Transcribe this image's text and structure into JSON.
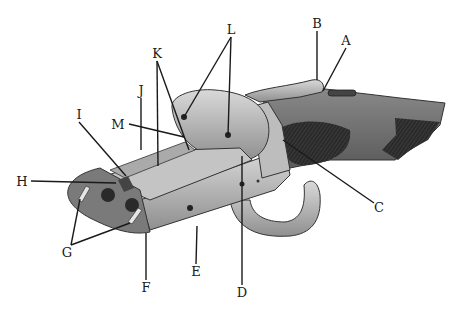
{
  "figure": {
    "style": "pencil illustration, grayscale",
    "colors": {
      "background": "#ffffff",
      "ink": "#1a1a1a",
      "metal_light": "#c8c8c8",
      "metal_mid": "#9a9a9a",
      "wood": "#6e6e6e",
      "checkering": "#2e2e2e"
    }
  },
  "labels": [
    {
      "id": "A",
      "text": "A",
      "x": 346,
      "y": 45,
      "targets": [
        [
          323,
          91
        ]
      ]
    },
    {
      "id": "B",
      "text": "B",
      "x": 317,
      "y": 28,
      "targets": [
        [
          317,
          80
        ]
      ]
    },
    {
      "id": "C",
      "text": "C",
      "x": 379,
      "y": 212,
      "targets": [
        [
          283,
          140
        ]
      ]
    },
    {
      "id": "D",
      "text": "D",
      "x": 242,
      "y": 297,
      "targets": [
        [
          242,
          156
        ]
      ]
    },
    {
      "id": "E",
      "text": "E",
      "x": 196,
      "y": 276,
      "targets": [
        [
          197,
          226
        ]
      ]
    },
    {
      "id": "F",
      "text": "F",
      "x": 146,
      "y": 292,
      "targets": [
        [
          146,
          233
        ]
      ]
    },
    {
      "id": "G",
      "text": "G",
      "x": 67,
      "y": 257,
      "targets": [
        [
          80,
          199
        ],
        [
          130,
          223
        ]
      ]
    },
    {
      "id": "H",
      "text": "H",
      "x": 22,
      "y": 186,
      "targets": [
        [
          116,
          183
        ]
      ]
    },
    {
      "id": "I",
      "text": "I",
      "x": 79,
      "y": 119,
      "targets": [
        [
          126,
          176
        ]
      ]
    },
    {
      "id": "J",
      "text": "J",
      "x": 141,
      "y": 95,
      "targets": [
        [
          141,
          150
        ]
      ]
    },
    {
      "id": "K",
      "text": "K",
      "x": 157,
      "y": 58,
      "targets": [
        [
          158,
          166
        ],
        [
          189,
          150
        ]
      ]
    },
    {
      "id": "L",
      "text": "L",
      "x": 231,
      "y": 34,
      "targets": [
        [
          184,
          117
        ],
        [
          228,
          135
        ]
      ]
    },
    {
      "id": "M",
      "text": "M",
      "x": 118,
      "y": 129,
      "targets": [
        [
          184,
          137
        ]
      ]
    }
  ]
}
